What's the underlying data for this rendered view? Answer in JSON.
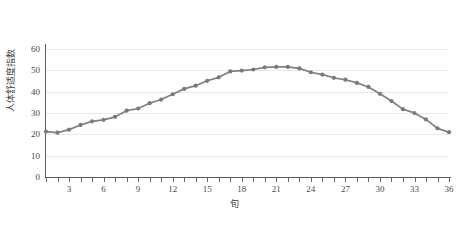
{
  "chart_data": {
    "type": "line",
    "title": "",
    "xlabel": "旬",
    "ylabel": "人体舒适度指数",
    "x": [
      1,
      2,
      3,
      4,
      5,
      6,
      7,
      8,
      9,
      10,
      11,
      12,
      13,
      14,
      15,
      16,
      17,
      18,
      19,
      20,
      21,
      22,
      23,
      24,
      25,
      26,
      27,
      28,
      29,
      30,
      31,
      32,
      33,
      34,
      35,
      36
    ],
    "values": [
      21.3,
      20.8,
      22.2,
      24.4,
      26.1,
      26.8,
      28.2,
      31.1,
      32.1,
      34.6,
      36.3,
      38.8,
      41.3,
      42.8,
      45.1,
      46.7,
      49.5,
      49.9,
      50.4,
      51.4,
      51.6,
      51.6,
      50.9,
      49.1,
      48.0,
      46.5,
      45.6,
      44.1,
      42.2,
      39.0,
      35.6,
      31.8,
      30.0,
      27.0,
      22.8,
      21.0
    ],
    "series": [
      {
        "name": "人体舒适度指数",
        "values": [
          21.3,
          20.8,
          22.2,
          24.4,
          26.1,
          26.8,
          28.2,
          31.1,
          32.1,
          34.6,
          36.3,
          38.8,
          41.3,
          42.8,
          45.1,
          46.7,
          49.5,
          49.9,
          50.4,
          51.4,
          51.6,
          51.6,
          50.9,
          49.1,
          48.0,
          46.5,
          45.6,
          44.1,
          42.2,
          39.0,
          35.6,
          31.8,
          30.0,
          27.0,
          22.8,
          21.0
        ],
        "color": "#808080"
      }
    ],
    "ylim": [
      0,
      65
    ],
    "y_ticks": [
      0,
      10,
      20,
      30,
      40,
      50,
      60
    ],
    "y_tick_labels": [
      "0",
      "10",
      "20",
      "30",
      "40",
      "50",
      "60"
    ],
    "xlim": [
      1,
      36
    ],
    "x_ticks": [
      3,
      6,
      9,
      12,
      15,
      18,
      21,
      24,
      27,
      30,
      33,
      36
    ],
    "x_tick_labels": [
      "3",
      "6",
      "9",
      "12",
      "15",
      "18",
      "21",
      "24",
      "27",
      "30",
      "33",
      "36"
    ],
    "x_minor_ticks": [
      1,
      2,
      3,
      4,
      5,
      6,
      7,
      8,
      9,
      10,
      11,
      12,
      13,
      14,
      15,
      16,
      17,
      18,
      19,
      20,
      21,
      22,
      23,
      24,
      25,
      26,
      27,
      28,
      29,
      30,
      31,
      32,
      33,
      34,
      35,
      36
    ],
    "grid": true,
    "grid_axis": "y",
    "legend": false,
    "marker": "circle",
    "colors": {
      "line": "#808080",
      "marker": "#7a7a7a",
      "grid": "#e9e9e9",
      "axis": "#5a5a5a",
      "text": "#4a4a4a",
      "background": "#ffffff"
    }
  }
}
